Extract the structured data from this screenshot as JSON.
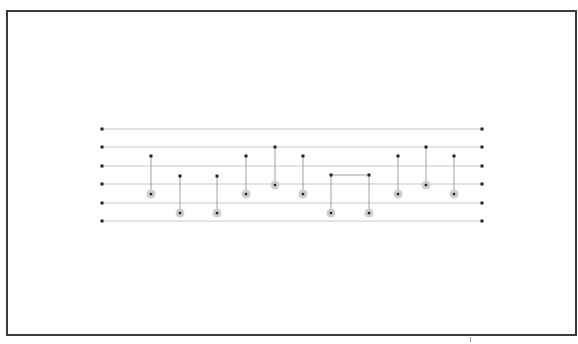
{
  "diagram": {
    "type": "sorting-network",
    "colors": {
      "frame": "#3a3a3a",
      "wire": "#c8c8c8",
      "endpoint": "#222222",
      "connector": "#a0a0a0",
      "target_ring": "#cfcfcf",
      "dot": "#222222"
    },
    "wires": {
      "x_start": 102,
      "x_end": 482,
      "y": [
        129,
        147,
        166,
        184,
        203,
        221
      ]
    },
    "gates": [
      {
        "x": 151,
        "y_top": 156,
        "y_bottom": 194
      },
      {
        "x": 180,
        "y_top": 176,
        "y_bottom": 213
      },
      {
        "x": 217,
        "y_top": 176,
        "y_bottom": 213
      },
      {
        "x": 246,
        "y_top": 156,
        "y_bottom": 194
      },
      {
        "x": 275,
        "y_top": 147,
        "y_bottom": 185
      },
      {
        "x": 303,
        "y_top": 156,
        "y_bottom": 194
      },
      {
        "x": 331,
        "y_top": 175,
        "y_bottom": 213,
        "bridge_to": 369
      },
      {
        "x": 369,
        "y_top": 175,
        "y_bottom": 213
      },
      {
        "x": 398,
        "y_top": 156,
        "y_bottom": 194
      },
      {
        "x": 426,
        "y_top": 147,
        "y_bottom": 185
      },
      {
        "x": 454,
        "y_top": 156,
        "y_bottom": 194
      }
    ]
  }
}
